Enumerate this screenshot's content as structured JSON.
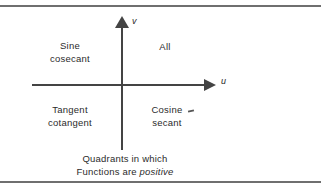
{
  "figure": {
    "title_caption": {
      "line1": "Quadrants in which",
      "line2_prefix": "Functions are ",
      "line2_emphasis": "positive"
    },
    "axes": {
      "vertical_label": "v",
      "horizontal_label": "u",
      "vertical_arrow_icon": "arrow-up-icon",
      "horizontal_arrow_icon": "arrow-right-icon"
    },
    "quadrants": [
      {
        "id": "quadrant-i",
        "position": "upper-right",
        "line1": "All",
        "line2": ""
      },
      {
        "id": "quadrant-ii",
        "position": "upper-left",
        "line1": "Sine",
        "line2": "cosecant"
      },
      {
        "id": "quadrant-iii",
        "position": "lower-left",
        "line1": "Tangent",
        "line2": "cotangent"
      },
      {
        "id": "quadrant-iv",
        "position": "lower-right",
        "line1": "Cosine",
        "line2": "secant"
      }
    ],
    "colors": {
      "background": "#ffffff",
      "frame_rule": "#6f6f6f",
      "axis": "#444444",
      "text": "#2b2b2b"
    }
  }
}
